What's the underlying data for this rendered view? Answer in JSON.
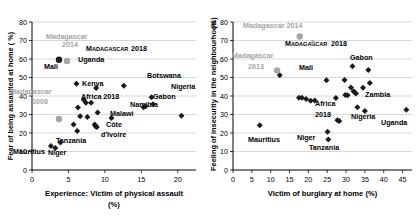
{
  "figure": {
    "panels": [
      "left",
      "right"
    ]
  },
  "chart_data": [
    {
      "id": "left",
      "type": "scatter",
      "title": "",
      "xlabel": "Experience:  Victim of physical assault",
      "xlabel_unit": "(%)",
      "ylabel": "Fear of being assaulted at home ( %)",
      "ylabel_unit": "",
      "xlim": [
        0,
        22.5
      ],
      "ylim": [
        0,
        80
      ],
      "xticks": [
        0,
        5,
        10,
        15,
        20
      ],
      "yticks": [
        0,
        10,
        20,
        30,
        40,
        50,
        60,
        70,
        80
      ],
      "grid": "horizontal",
      "legend": "none",
      "series": [
        {
          "name": "Countries 2018",
          "marker": "diamond",
          "color": "#1a1a1a",
          "points": [
            {
              "x": 2.6,
              "y": 13.0,
              "label": "Mauritius"
            },
            {
              "x": 3.2,
              "y": 11.9,
              "label": ""
            },
            {
              "x": 3.9,
              "y": 14.8,
              "label": "Niger"
            },
            {
              "x": 5.7,
              "y": 24.6,
              "label": ""
            },
            {
              "x": 6.1,
              "y": 46.6,
              "label": "Mali"
            },
            {
              "x": 6.2,
              "y": 21.1,
              "label": ""
            },
            {
              "x": 6.3,
              "y": 33.8,
              "label": ""
            },
            {
              "x": 6.6,
              "y": 29.0,
              "label": ""
            },
            {
              "x": 7.1,
              "y": 38.0,
              "label": ""
            },
            {
              "x": 7.4,
              "y": 36.3,
              "label": ""
            },
            {
              "x": 7.6,
              "y": 28.7,
              "label": ""
            },
            {
              "x": 8.1,
              "y": 36.4,
              "label": ""
            },
            {
              "x": 8.6,
              "y": 24.6,
              "label": ""
            },
            {
              "x": 8.7,
              "y": 23.6,
              "label": ""
            },
            {
              "x": 8.8,
              "y": 44.3,
              "label": ""
            },
            {
              "x": 8.9,
              "y": 23.2,
              "label": ""
            },
            {
              "x": 9.0,
              "y": 31.1,
              "label": "Africa 2018"
            },
            {
              "x": 10.9,
              "y": 28.1,
              "label": ""
            },
            {
              "x": 12.6,
              "y": 45.6,
              "label": "Uganda"
            },
            {
              "x": 15.3,
              "y": 33.9,
              "label": ""
            },
            {
              "x": 15.6,
              "y": 34.5,
              "label": ""
            },
            {
              "x": 16.4,
              "y": 39.3,
              "label": "Botswana"
            },
            {
              "x": 16.6,
              "y": 35.5,
              "label": ""
            },
            {
              "x": 20.5,
              "y": 29.3,
              "label": "Nigeria"
            }
          ]
        },
        {
          "name": "Madagascar 2018",
          "marker": "circle",
          "color": "#1a1a1a",
          "points": [
            {
              "x": 3.7,
              "y": 59.6,
              "label": "MADAGASCAR 2018"
            }
          ]
        },
        {
          "name": "Madagascar previous",
          "marker": "circle",
          "color": "#a6a6a6",
          "points": [
            {
              "x": 4.8,
              "y": 58.9,
              "label": "Madagascar 2014"
            },
            {
              "x": 3.7,
              "y": 27.6,
              "label": "Madagascar 2008"
            }
          ]
        }
      ],
      "annotations": [
        {
          "text": "Madagascar",
          "x_px": 46,
          "y_px": 39,
          "color": "#a6a6a6",
          "size": "normal"
        },
        {
          "text": "2014",
          "x_px": 62,
          "y_px": 47,
          "color": "#a6a6a6",
          "size": "normal"
        },
        {
          "text": "M",
          "x_px": 86,
          "y_px": 51,
          "color": "#1a1a1a",
          "size": "normal"
        },
        {
          "text": "ADAGASCAR",
          "x_px": 92,
          "y_px": 51,
          "color": "#1a1a1a",
          "size": "small"
        },
        {
          "text": "2018",
          "x_px": 131,
          "y_px": 51,
          "color": "#1a1a1a",
          "size": "normal"
        },
        {
          "text": "Mali",
          "x_px": 44,
          "y_px": 69,
          "color": "#1a1a1a",
          "size": "normal"
        },
        {
          "text": "Uganda",
          "x_px": 78,
          "y_px": 62,
          "color": "#1a1a1a",
          "size": "normal"
        },
        {
          "text": "Botswana",
          "x_px": 147,
          "y_px": 78,
          "color": "#1a1a1a",
          "size": "normal"
        },
        {
          "text": "Kenya",
          "x_px": 82,
          "y_px": 86,
          "color": "#1a1a1a",
          "size": "normal"
        },
        {
          "text": "Nigeria",
          "x_px": 171,
          "y_px": 89,
          "color": "#1a1a1a",
          "size": "normal"
        },
        {
          "text": "Madagascar",
          "x_px": 10,
          "y_px": 94,
          "color": "#a6a6a6",
          "size": "normal"
        },
        {
          "text": "2008",
          "x_px": 32,
          "y_px": 104,
          "color": "#a6a6a6",
          "size": "normal"
        },
        {
          "text": "Africa 2018",
          "x_px": 81,
          "y_px": 99,
          "color": "#1a1a1a",
          "size": "normal"
        },
        {
          "text": "Gabon",
          "x_px": 153,
          "y_px": 99,
          "color": "#1a1a1a",
          "size": "normal"
        },
        {
          "text": "Namibia",
          "x_px": 130,
          "y_px": 107,
          "color": "#1a1a1a",
          "size": "normal"
        },
        {
          "text": "Malawi",
          "x_px": 110,
          "y_px": 116,
          "color": "#1a1a1a",
          "size": "normal"
        },
        {
          "text": "Côte",
          "x_px": 106,
          "y_px": 127,
          "color": "#1a1a1a",
          "size": "normal"
        },
        {
          "text": "d'Ivoire",
          "x_px": 101,
          "y_px": 137,
          "color": "#1a1a1a",
          "size": "normal"
        },
        {
          "text": "Tanzania",
          "x_px": 56,
          "y_px": 143,
          "color": "#1a1a1a",
          "size": "normal"
        },
        {
          "text": "Mauritius",
          "x_px": 13,
          "y_px": 154,
          "color": "#1a1a1a",
          "size": "normal"
        },
        {
          "text": "Niger",
          "x_px": 48,
          "y_px": 155,
          "color": "#1a1a1a",
          "size": "normal"
        }
      ]
    },
    {
      "id": "right",
      "type": "scatter",
      "title": "",
      "xlabel": "Victim of burglary at home (%)",
      "xlabel_unit": "",
      "ylabel": "Feeling of insecurity in the neighbourhood",
      "ylabel_unit": "(%)",
      "xlim": [
        0,
        47.5
      ],
      "ylim": [
        0,
        80
      ],
      "xticks": [
        0,
        5,
        10,
        15,
        20,
        25,
        30,
        35,
        40,
        45
      ],
      "yticks": [
        0,
        10,
        20,
        30,
        40,
        50,
        60,
        70,
        80
      ],
      "grid": "horizontal",
      "legend": "none",
      "series": [
        {
          "name": "Countries 2018",
          "marker": "diamond",
          "color": "#1a1a1a",
          "points": [
            {
              "x": 7.1,
              "y": 24.2,
              "label": "Mauritius"
            },
            {
              "x": 12.4,
              "y": 51.2,
              "label": ""
            },
            {
              "x": 17.5,
              "y": 39.1,
              "label": ""
            },
            {
              "x": 18.3,
              "y": 39.1,
              "label": ""
            },
            {
              "x": 19.4,
              "y": 38.4,
              "label": ""
            },
            {
              "x": 20.6,
              "y": 37.5,
              "label": ""
            },
            {
              "x": 21.7,
              "y": 37.6,
              "label": ""
            },
            {
              "x": 24.8,
              "y": 48.5,
              "label": "Mali"
            },
            {
              "x": 25.1,
              "y": 20.7,
              "label": "Niger"
            },
            {
              "x": 25.3,
              "y": 16.5,
              "label": "Tanzania"
            },
            {
              "x": 27.3,
              "y": 38.9,
              "label": ""
            },
            {
              "x": 27.7,
              "y": 26.9,
              "label": ""
            },
            {
              "x": 28.2,
              "y": 26.5,
              "label": ""
            },
            {
              "x": 29.6,
              "y": 48.6,
              "label": ""
            },
            {
              "x": 29.8,
              "y": 40.6,
              "label": ""
            },
            {
              "x": 30.4,
              "y": 40.4,
              "label": ""
            },
            {
              "x": 31.3,
              "y": 44.6,
              "label": ""
            },
            {
              "x": 31.7,
              "y": 56.1,
              "label": "Gabon"
            },
            {
              "x": 32.0,
              "y": 42.6,
              "label": ""
            },
            {
              "x": 32.3,
              "y": 42.0,
              "label": ""
            },
            {
              "x": 32.6,
              "y": 41.4,
              "label": ""
            },
            {
              "x": 33.0,
              "y": 33.9,
              "label": ""
            },
            {
              "x": 34.5,
              "y": 44.5,
              "label": ""
            },
            {
              "x": 35.0,
              "y": 31.9,
              "label": "Nigeria"
            },
            {
              "x": 35.9,
              "y": 54.1,
              "label": ""
            },
            {
              "x": 36.3,
              "y": 47.0,
              "label": "Zambia"
            },
            {
              "x": 46.0,
              "y": 32.6,
              "label": "Uganda"
            }
          ]
        },
        {
          "name": "Madagascar 2018",
          "marker": "diamond",
          "color": "#a6a6a6",
          "points": [
            {
              "x": 21.2,
              "y": 68.8,
              "label": "MADAGASCAR 2018"
            }
          ]
        },
        {
          "name": "Madagascar previous",
          "marker": "circle",
          "color": "#a6a6a6",
          "points": [
            {
              "x": 17.7,
              "y": 72.2,
              "label": "Madagascar 2014"
            },
            {
              "x": 11.7,
              "y": 53.8,
              "label": "Madagascar 2013"
            }
          ]
        }
      ],
      "annotations": [
        {
          "text": "Madagascar 2014",
          "x_px": 38,
          "y_px": 28,
          "color": "#a6a6a6",
          "size": "normal"
        },
        {
          "text": "M",
          "x_px": 80,
          "y_px": 46,
          "color": "#1a1a1a",
          "size": "normal"
        },
        {
          "text": "ADAGASCAR",
          "x_px": 86,
          "y_px": 46,
          "color": "#1a1a1a",
          "size": "small"
        },
        {
          "text": "2018",
          "x_px": 126,
          "y_px": 46,
          "color": "#1a1a1a",
          "size": "normal"
        },
        {
          "text": "Madagascar",
          "x_px": 27,
          "y_px": 58,
          "color": "#a6a6a6",
          "size": "normal"
        },
        {
          "text": "2013",
          "x_px": 43,
          "y_px": 69,
          "color": "#a6a6a6",
          "size": "normal"
        },
        {
          "text": "Gabon",
          "x_px": 145,
          "y_px": 60,
          "color": "#1a1a1a",
          "size": "normal"
        },
        {
          "text": "Mali",
          "x_px": 94,
          "y_px": 70,
          "color": "#1a1a1a",
          "size": "normal"
        },
        {
          "text": "Zambia",
          "x_px": 160,
          "y_px": 97,
          "color": "#1a1a1a",
          "size": "normal"
        },
        {
          "text": "Africa",
          "x_px": 110,
          "y_px": 106,
          "color": "#1a1a1a",
          "size": "normal"
        },
        {
          "text": "2018",
          "x_px": 110,
          "y_px": 117,
          "color": "#1a1a1a",
          "size": "normal"
        },
        {
          "text": "Nigeria",
          "x_px": 146,
          "y_px": 119,
          "color": "#1a1a1a",
          "size": "normal"
        },
        {
          "text": "Uganda",
          "x_px": 176,
          "y_px": 125,
          "color": "#1a1a1a",
          "size": "normal"
        },
        {
          "text": "Mauritius",
          "x_px": 43,
          "y_px": 142,
          "color": "#1a1a1a",
          "size": "normal"
        },
        {
          "text": "Niger",
          "x_px": 92,
          "y_px": 140,
          "color": "#1a1a1a",
          "size": "normal"
        },
        {
          "text": "Tanzania",
          "x_px": 104,
          "y_px": 150,
          "color": "#1a1a1a",
          "size": "normal"
        }
      ]
    }
  ]
}
